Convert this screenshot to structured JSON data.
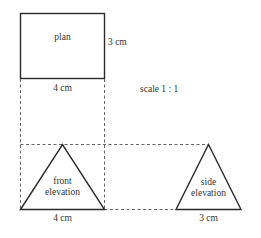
{
  "diagram": {
    "scale_label": "scale 1 : 1",
    "plan": {
      "label": "plan",
      "width_label": "4 cm",
      "depth_label": "3 cm"
    },
    "front_elevation": {
      "label_line1": "front",
      "label_line2": "elevation",
      "width_label": "4 cm"
    },
    "side_elevation": {
      "label_line1": "side",
      "label_line2": "elevation",
      "width_label": "3 cm"
    },
    "colors": {
      "line": "#2a2a2a",
      "dashed": "#555555",
      "text": "#333333",
      "background": "#ffffff"
    }
  }
}
